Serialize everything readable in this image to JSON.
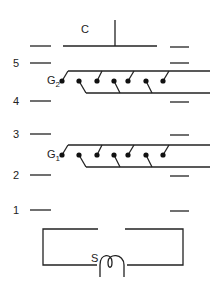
{
  "diagram": {
    "type": "vacuum tube electrode schematic",
    "labels": {
      "anode": "C",
      "grid2_main": "G",
      "grid2_sub": "2",
      "grid1_main": "G",
      "grid1_sub": "1",
      "filament": "S"
    },
    "levels": [
      {
        "label": "5",
        "y": 63
      },
      {
        "label": "4",
        "y": 101
      },
      {
        "label": "3",
        "y": 134
      },
      {
        "label": "2",
        "y": 175
      },
      {
        "label": "1",
        "y": 210
      }
    ],
    "colors": {
      "line": "#222222",
      "background": "#ffffff"
    }
  }
}
